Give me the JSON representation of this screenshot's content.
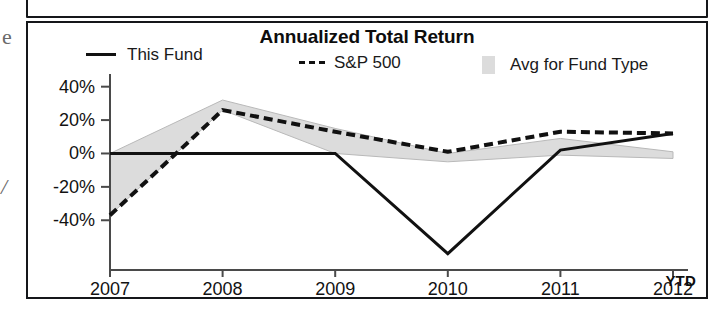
{
  "chart_data": {
    "type": "line",
    "title": "Annualized Total Return",
    "xlabel": "",
    "ylabel": "",
    "categories": [
      "2007",
      "2008",
      "2009",
      "2010",
      "2011",
      "2012"
    ],
    "x_axis_suffix_label": "YTD",
    "x_tick_labels": [
      "2007",
      "2008",
      "2009",
      "2010",
      "2011",
      "2012"
    ],
    "y_tick_labels": [
      "40%",
      "20%",
      "0%",
      "-20%",
      "-40%"
    ],
    "y_tick_values": [
      40,
      20,
      0,
      -20,
      -40
    ],
    "ylim": [
      -62,
      44
    ],
    "y_unit": "%",
    "grid": false,
    "legend_position": "top",
    "series": [
      {
        "name": "This Fund",
        "style": "solid-line",
        "color": "#111111",
        "values": [
          0,
          0,
          0,
          -60,
          2,
          12
        ]
      },
      {
        "name": "S&P 500",
        "style": "dashed-line",
        "color": "#111111",
        "values": [
          -37,
          26,
          13,
          1,
          13,
          12
        ]
      },
      {
        "name": "Avg for Fund Type",
        "style": "shaded-band",
        "color": "#dcdcdc",
        "band_upper": [
          0,
          32,
          15,
          0,
          9,
          1
        ],
        "band_lower": [
          -37,
          26,
          0,
          -5,
          -1,
          -3
        ]
      }
    ],
    "legend": [
      {
        "label": "This Fund",
        "marker": "solid-line-swatch"
      },
      {
        "label": "S&P 500",
        "marker": "dashed-line-swatch"
      },
      {
        "label": "Avg for Fund Type",
        "marker": "shaded-area-swatch"
      }
    ],
    "colors": {
      "line": "#111111",
      "band_fill": "#dcdcdc",
      "axis": "#4a4a4a",
      "panel_border": "#15171a",
      "text": "#121212"
    }
  },
  "margin_artifacts": {
    "glyph_top": "e",
    "glyph_mid": "/"
  }
}
